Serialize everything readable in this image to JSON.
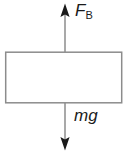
{
  "figure": {
    "type": "free-body-diagram",
    "canvas": {
      "width": 129,
      "height": 154
    },
    "colors": {
      "stroke": "#8c8c8c",
      "text": "#1a1a1a",
      "background": "#ffffff"
    },
    "body": {
      "shape": "rectangle",
      "x": 5,
      "y": 52,
      "width": 117,
      "height": 51,
      "fill": "none",
      "stroke_width": 1.4
    },
    "forces": [
      {
        "name": "buoyant-force",
        "symbol": "F",
        "subscript": "B",
        "direction": "up",
        "line_x": 65,
        "tail_y": 52,
        "tip_y": 4,
        "label_text": "F"
      },
      {
        "name": "weight-force",
        "symbol": "mg",
        "subscript": "",
        "direction": "down",
        "line_x": 65,
        "tail_y": 103,
        "tip_y": 150,
        "label_text": "mg"
      }
    ],
    "labels": {
      "buoyant": {
        "base": "F",
        "sub": "B"
      },
      "weight": {
        "base": "mg"
      }
    }
  }
}
